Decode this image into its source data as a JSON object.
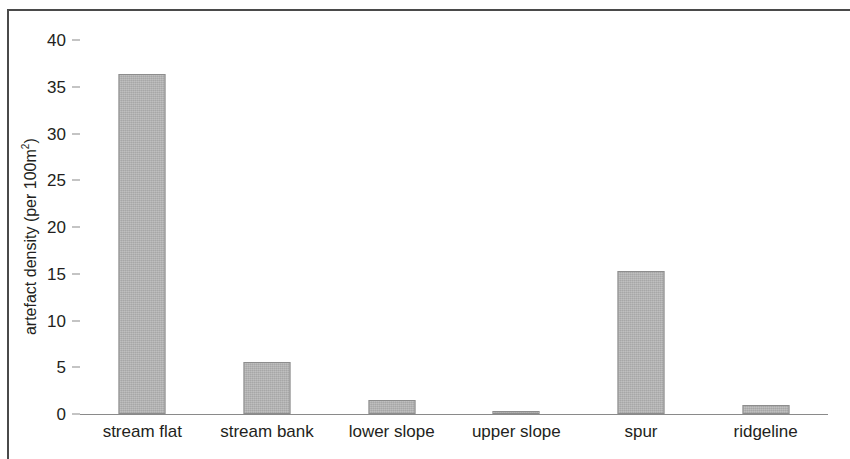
{
  "chart_data": {
    "type": "bar",
    "title": "",
    "xlabel": "",
    "ylabel": "artefact density (per 100m²)",
    "ylabel_main": "artefact density (per 100m",
    "ylabel_sup": "2",
    "ylabel_tail": ")",
    "categories": [
      "stream flat",
      "stream bank",
      "lower slope",
      "upper slope",
      "spur",
      "ridgeline"
    ],
    "values": [
      36.4,
      5.6,
      1.5,
      0.3,
      15.3,
      1.0
    ],
    "ylim": [
      0,
      40
    ],
    "yticks": [
      0,
      5,
      10,
      15,
      20,
      25,
      30,
      35,
      40
    ],
    "ytick_labels": [
      "0",
      "5",
      "10",
      "15",
      "20",
      "25",
      "30",
      "35",
      "40"
    ],
    "grid": false,
    "legend": false,
    "bar_fill_color": "#b9b9b9",
    "bar_border_color": "#8d8d8d",
    "axis_color": "#8a8a8a",
    "text_color": "#231f20"
  }
}
